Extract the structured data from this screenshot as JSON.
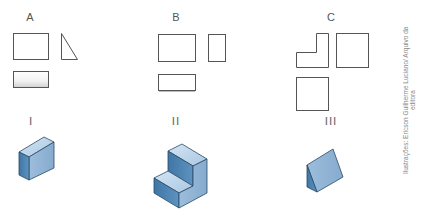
{
  "figure": {
    "view_sets": [
      {
        "label": "A",
        "views": [
          "rectangle",
          "right-triangle",
          "flat-rectangle"
        ]
      },
      {
        "label": "B",
        "views": [
          "rectangle",
          "tall-narrow-rectangle",
          "flat-rectangle"
        ]
      },
      {
        "label": "C",
        "views": [
          "L-shape",
          "square",
          "square"
        ]
      }
    ],
    "solids": [
      {
        "label": "I",
        "shape": "rectangular-block"
      },
      {
        "label": "II",
        "shape": "stepped-block"
      },
      {
        "label": "III",
        "shape": "triangular-prism"
      }
    ],
    "credits": "Ilustrações: Ericson Guilherme Luciano/ Arquivo da editora",
    "colors": {
      "outline": "#555555",
      "solid_light": "#b9d3e8",
      "solid_mid": "#8fb3d4",
      "solid_dark": "#4f86b3",
      "solid_edge": "#2a4a66"
    }
  }
}
